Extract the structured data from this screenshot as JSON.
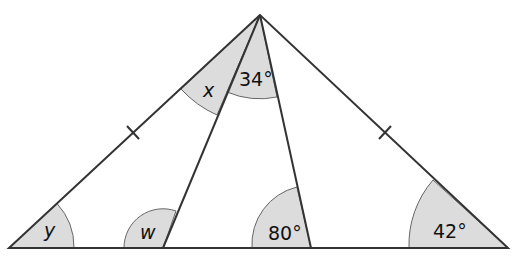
{
  "diagram": {
    "type": "geometry-triangle",
    "colors": {
      "line": "#333333",
      "sector_fill": "#dcdcdc",
      "sector_stroke": "#666666"
    },
    "points": {
      "apex": [
        260,
        15
      ],
      "bottom_left": [
        9,
        248
      ],
      "bottom_right": [
        508,
        248
      ],
      "cevian_left_foot": [
        163,
        248
      ],
      "cevian_right_foot": [
        311,
        248
      ]
    },
    "equal_side_marks": 2,
    "labels": {
      "x": "x",
      "y": "y",
      "w": "w",
      "apex_angle": "34°",
      "angle_80": "80°",
      "angle_42": "42°"
    }
  }
}
